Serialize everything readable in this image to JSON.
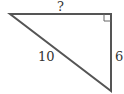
{
  "diagram": {
    "type": "right-triangle",
    "labels": {
      "top_side": "?",
      "hypotenuse": "10",
      "right_side": "6"
    },
    "right_angle_marker": "top-right",
    "stroke_color": "#555555",
    "background": "#ffffff"
  }
}
